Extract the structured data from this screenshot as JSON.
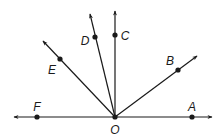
{
  "diagram": {
    "type": "rays-from-common-endpoint",
    "vertex": {
      "label": "O",
      "x": 115,
      "y": 117,
      "label_x": 115,
      "label_y": 130
    },
    "line": {
      "description": "straight line through F, O, A with arrows both ends",
      "left_tip": [
        14,
        117
      ],
      "right_tip": [
        212,
        117
      ]
    },
    "points": [
      {
        "label": "A",
        "x": 192,
        "y": 117,
        "label_x": 192,
        "label_y": 107
      },
      {
        "label": "B",
        "x": 178,
        "y": 70,
        "label_x": 170,
        "label_y": 61
      },
      {
        "label": "C",
        "x": 115,
        "y": 35,
        "label_x": 125,
        "label_y": 36
      },
      {
        "label": "D",
        "x": 95,
        "y": 37,
        "label_x": 85,
        "label_y": 41
      },
      {
        "label": "E",
        "x": 60,
        "y": 59,
        "label_x": 52,
        "label_y": 70
      },
      {
        "label": "F",
        "x": 37,
        "y": 117,
        "label_x": 37,
        "label_y": 107
      }
    ],
    "rays": [
      {
        "name": "OB",
        "tip": [
          197,
          56
        ]
      },
      {
        "name": "OC",
        "tip": [
          115,
          11
        ]
      },
      {
        "name": "OD",
        "tip": [
          90,
          14
        ]
      },
      {
        "name": "OE",
        "tip": [
          43,
          41
        ]
      }
    ],
    "colors": {
      "stroke": "#1a1a1a",
      "background": "#ffffff"
    }
  },
  "labels": {
    "O": "O",
    "A": "A",
    "B": "B",
    "C": "C",
    "D": "D",
    "E": "E",
    "F": "F"
  }
}
